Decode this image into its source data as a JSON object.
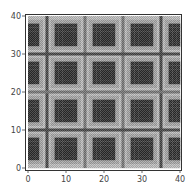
{
  "chart_data": {
    "type": "heatmap",
    "title": "",
    "xlabel": "",
    "ylabel": "",
    "xlim": [
      0,
      40
    ],
    "ylim": [
      0,
      40
    ],
    "grid": false,
    "legend": null,
    "colormap": "grayscale (dark = high), dithered",
    "x_ticks": [
      0,
      10,
      20,
      30,
      40
    ],
    "y_ticks": [
      0,
      10,
      20,
      30,
      40
    ],
    "x_tick_labels": [
      "0",
      "10",
      "20",
      "30",
      "40"
    ],
    "y_tick_labels": [
      "0",
      "10",
      "20",
      "30",
      "40"
    ],
    "levels_note": "z rows listed top (y=40) to bottom (y=0); each char is a darkness level 0-9 for a 1x1 cell",
    "z": [
      "2222222222222222222222222222222222222222",
      "3333223333333322333333332233333333223333",
      "8883223888888322388888832238888883223888",
      "8883223888888322388888832238888883223888",
      "8883223888888322388888832238888883223888",
      "8883223888888322388888832238888883223888",
      "8883223888888322388888832238888883223888",
      "8883223888888322388888832238888883223888",
      "3333223333333322333333332233333333223333",
      "2222222222222222222222222222222222222222",
      "2222222222222222222222222222222222222222",
      "3333223333333322333333332233333333223333",
      "8883223888888322388888832238888883223888",
      "8883223888888322388888832238888883223888",
      "8883223888888322388888832238888883223888",
      "8883223888888322388888832238888883223888",
      "8883223888888322388888832238888883223888",
      "8883223888888322388888832238888883223888",
      "3333223333333322333333332233333333223333",
      "2222222222222222222222222222222222222222",
      "2222222222222222222222222222222222222222",
      "3333223333333322333333332233333333223333",
      "8883223888888322388888832238888883223888",
      "8883223888888322388888832238888883223888",
      "8883223888888322388888832238888883223888",
      "8883223888888322388888832238888883223888",
      "8883223888888322388888832238888883223888",
      "8883223888888322388888832238888883223888",
      "3333223333333322333333332233333333223333",
      "2222222222222222222222222222222222222222",
      "2222222222222222222222222222222222222222",
      "3333223333333322333333332233333333223333",
      "8883223888888322388888832238888883223888",
      "8883223888888322388888832238888883223888",
      "8883223888888322388888832238888883223888",
      "8883223888888322388888832238888883223888",
      "8883223888888322388888832238888883223888",
      "8883223888888322388888832238888883223888",
      "3333223333333322333333332233333333223333",
      "2222222222222222222222222222222222222222"
    ],
    "lines": {
      "vertical": [
        {
          "x": 5,
          "level": 7
        },
        {
          "x": 15,
          "level": 5
        },
        {
          "x": 25,
          "level": 5
        },
        {
          "x": 35,
          "level": 7
        }
      ],
      "horizontal": [
        {
          "y": 10,
          "level": 7
        },
        {
          "y": 20,
          "level": 5
        },
        {
          "y": 30,
          "level": 7
        }
      ]
    }
  },
  "style": {
    "frame_color": "#333333",
    "tick_color": "#444444",
    "background": "#ffffff"
  }
}
